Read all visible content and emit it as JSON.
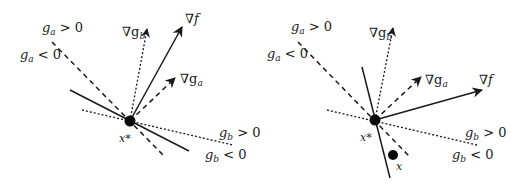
{
  "figure": {
    "panels": [
      {
        "id": "left",
        "point_label": "x*",
        "labels": {
          "grad_f": "∇f",
          "grad_gb": "∇g",
          "grad_gb_sub": "b",
          "grad_ga": "∇g",
          "grad_ga_sub": "a",
          "ga_pos": "g",
          "ga_pos_sub": "a",
          "ga_pos_rel": " > 0",
          "ga_neg": "g",
          "ga_neg_sub": "a",
          "ga_neg_rel": " < 0",
          "gb_pos": "g",
          "gb_pos_sub": "b",
          "gb_pos_rel": " > 0",
          "gb_neg": "g",
          "gb_neg_sub": "b",
          "gb_neg_rel": " < 0",
          "xstar": "x*"
        }
      },
      {
        "id": "right",
        "point_label": "x*",
        "extra_point_label": "x",
        "labels": {
          "grad_f": "∇f",
          "grad_gb": "∇g",
          "grad_gb_sub": "b",
          "grad_ga": "∇g",
          "grad_ga_sub": "a",
          "ga_pos": "g",
          "ga_pos_sub": "a",
          "ga_pos_rel": " > 0",
          "ga_neg": "g",
          "ga_neg_sub": "a",
          "ga_neg_rel": " < 0",
          "gb_pos": "g",
          "gb_pos_sub": "b",
          "gb_pos_rel": " > 0",
          "gb_neg": "g",
          "gb_neg_sub": "b",
          "gb_neg_rel": " < 0",
          "xstar": "x*",
          "x": "x"
        }
      }
    ],
    "legend_semantics": {
      "solid_line": "level set / tangent of f and gradient of f",
      "dashed_line": "constraint boundary g_a = 0 and gradient of g_a",
      "dotted_line": "constraint boundary g_b = 0 and gradient of g_b"
    }
  }
}
